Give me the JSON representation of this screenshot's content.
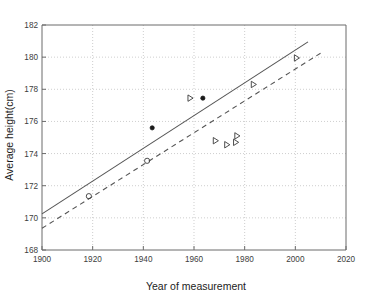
{
  "chart_data": {
    "type": "scatter",
    "title": "",
    "xlabel": "Year of measurement",
    "ylabel": "Average height(cm)",
    "xlim": [
      1900,
      2020
    ],
    "ylim": [
      168,
      182
    ],
    "xticks": [
      1900,
      1920,
      1940,
      1960,
      1980,
      2000,
      2020
    ],
    "xticklabels": [
      "1900",
      "1920",
      "1940",
      "1960",
      "1980",
      "2000",
      "2020"
    ],
    "yticks": [
      168,
      170,
      172,
      174,
      176,
      178,
      180,
      182
    ],
    "yticklabels": [
      "168",
      "170",
      "172",
      "174",
      "176",
      "178",
      "180",
      "182"
    ],
    "grid": "dotted",
    "legend": "none",
    "series": [
      {
        "name": "upper-trend-line",
        "type": "line",
        "style": "solid",
        "x": [
          1900,
          2005
        ],
        "y": [
          170.25,
          180.95
        ]
      },
      {
        "name": "lower-trend-line",
        "type": "line",
        "style": "dashed",
        "x": [
          1900,
          2010
        ],
        "y": [
          169.35,
          180.25
        ]
      },
      {
        "name": "filled-dot-points",
        "type": "scatter",
        "marker": "filled-circle",
        "points": [
          {
            "x": 1943.5,
            "y": 175.6
          },
          {
            "x": 1963.5,
            "y": 177.45
          }
        ]
      },
      {
        "name": "open-circle-points",
        "type": "scatter",
        "marker": "open-circle",
        "points": [
          {
            "x": 1918.5,
            "y": 171.35
          },
          {
            "x": 1941.5,
            "y": 173.55
          }
        ]
      },
      {
        "name": "triangle-points",
        "type": "scatter",
        "marker": "open-triangle-right",
        "points": [
          {
            "x": 1958.5,
            "y": 177.45
          },
          {
            "x": 1968.5,
            "y": 174.8
          },
          {
            "x": 1977.0,
            "y": 175.1
          },
          {
            "x": 1976.5,
            "y": 174.7
          },
          {
            "x": 1973.0,
            "y": 174.55
          },
          {
            "x": 1983.5,
            "y": 178.3
          },
          {
            "x": 2000.5,
            "y": 179.95
          }
        ]
      }
    ]
  },
  "axis_titles": {
    "x": "Year of measurement",
    "y": "Average height(cm)"
  }
}
